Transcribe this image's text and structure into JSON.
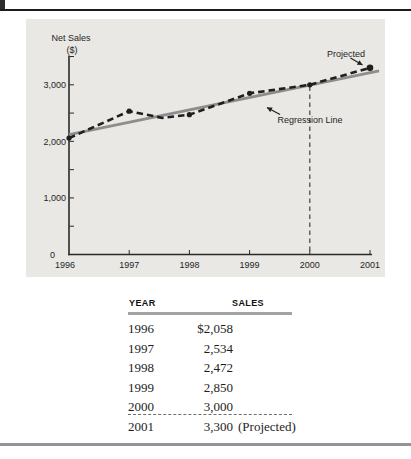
{
  "decor": {
    "top_rule_color": "#1c1c1c",
    "bottom_rule_color": "#949494",
    "corner_mark_color": "#2e2e2e"
  },
  "chart_data": {
    "type": "line",
    "ylabel_line1": "Net Sales",
    "ylabel_line2": "($)",
    "panel_bg": "#e9e8e4",
    "axis_color": "#2a2a2a",
    "xlim": [
      1996,
      2001.25
    ],
    "ylim": [
      0,
      3500
    ],
    "y_minor_step": 500,
    "y_ticks": [
      {
        "value": 0,
        "label": "0"
      },
      {
        "value": 1000,
        "label": "1,000"
      },
      {
        "value": 2000,
        "label": "2,000"
      },
      {
        "value": 3000,
        "label": "3,000"
      }
    ],
    "x_ticks": [
      {
        "year": 1996,
        "label": "1996"
      },
      {
        "year": 1997,
        "label": "1997"
      },
      {
        "year": 1998,
        "label": "1998"
      },
      {
        "year": 1999,
        "label": "1999"
      },
      {
        "year": 2000,
        "label": "2000"
      },
      {
        "year": 2001,
        "label": "2001"
      }
    ],
    "series": [
      {
        "name": "Net Sales (actual and projected)",
        "style": "dashed",
        "color": "#1f1f1f",
        "points": [
          [
            1996,
            2058
          ],
          [
            1997,
            2534
          ],
          [
            1997.55,
            2415
          ],
          [
            1998,
            2472
          ],
          [
            1999,
            2850
          ],
          [
            2000,
            3000
          ],
          [
            2001,
            3300
          ]
        ],
        "marker_points": [
          [
            1996,
            2058
          ],
          [
            1997,
            2534
          ],
          [
            1998,
            2472
          ],
          [
            1999,
            2850
          ],
          [
            2000,
            3000
          ],
          [
            2001,
            3300
          ]
        ]
      },
      {
        "name": "Regression Line",
        "style": "solid",
        "color": "#8d8d8d",
        "points": [
          [
            1996,
            2120
          ],
          [
            2001.15,
            3245
          ]
        ]
      }
    ],
    "reference_line": {
      "year": 2000,
      "value_top": 2970,
      "color": "#5a5a5a"
    },
    "annotations": {
      "projected": "Projected",
      "regression": "Regression Line"
    }
  },
  "table": {
    "headers": [
      "YEAR",
      "SALES"
    ],
    "rows": [
      {
        "year": "1996",
        "amount": "$2,058",
        "suffix": ""
      },
      {
        "year": "1997",
        "amount": "2,534",
        "suffix": ""
      },
      {
        "year": "1998",
        "amount": "2,472",
        "suffix": ""
      },
      {
        "year": "1999",
        "amount": "2,850",
        "suffix": ""
      },
      {
        "year": "2000",
        "amount": "3,000",
        "suffix": ""
      },
      {
        "year": "2001",
        "amount": "3,300",
        "suffix": "(Projected)"
      }
    ],
    "divider_after_row_index": 4
  }
}
